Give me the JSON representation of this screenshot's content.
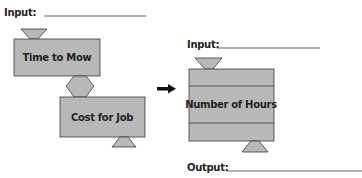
{
  "diagram": {
    "colors": {
      "fill": "#b8b8b8",
      "stroke": "#3a3a3a",
      "text": "#222222"
    },
    "left": {
      "input_label": "Input:",
      "machine1_label": "Time to Mow",
      "machine2_label": "Cost for Job"
    },
    "arrow": {
      "icon": "right-arrow-icon"
    },
    "right": {
      "input_label": "Input:",
      "machine_label": "Number of Hours",
      "output_label": "Output:"
    }
  }
}
